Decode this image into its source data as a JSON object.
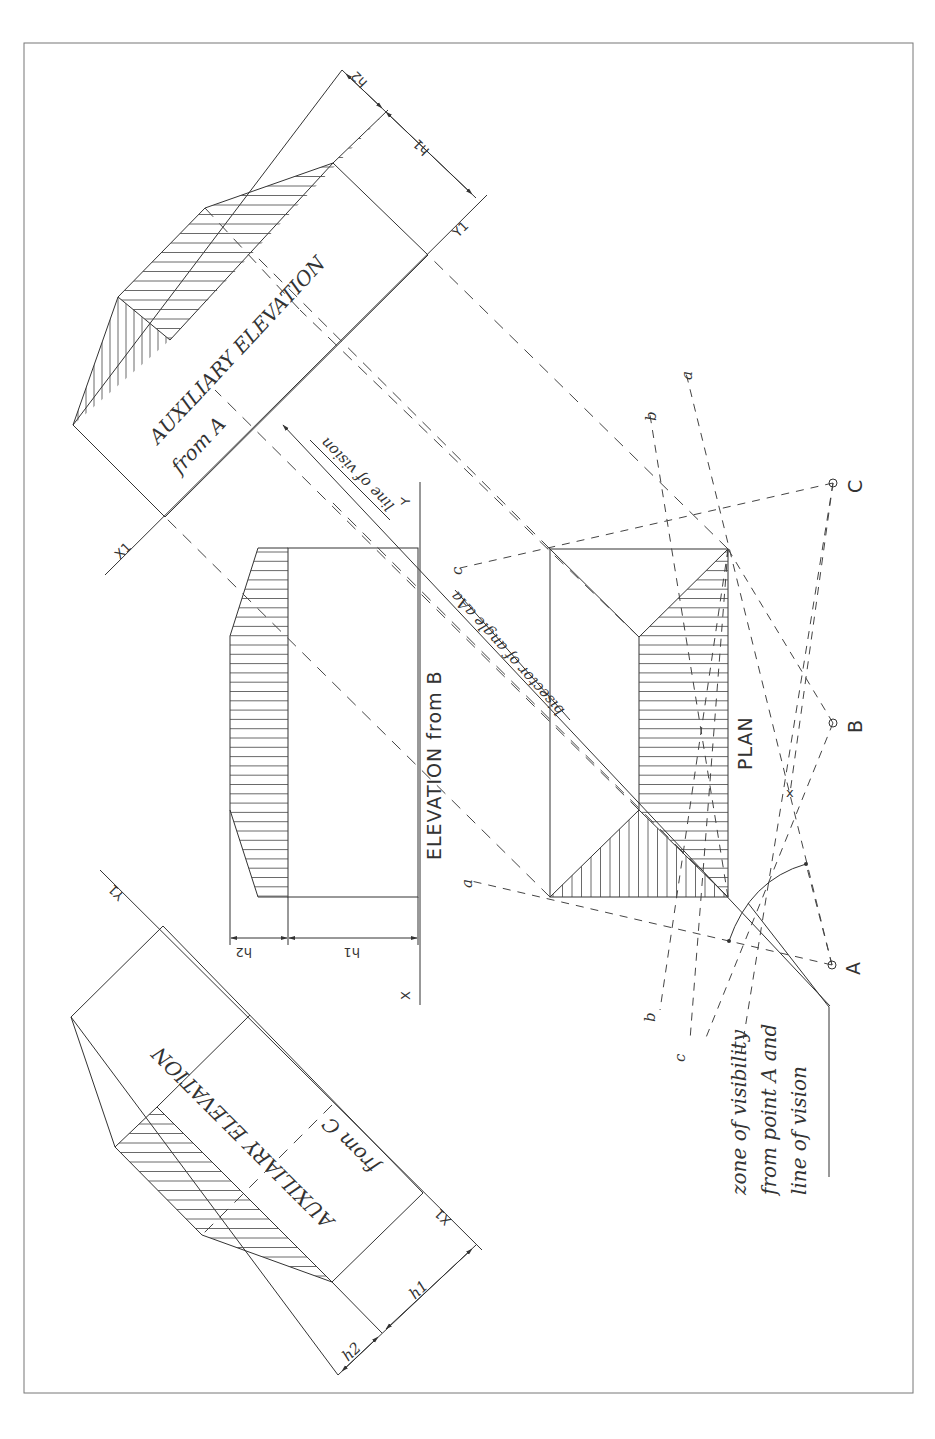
{
  "drawing": {
    "type": "orthographic projection - auxiliary elevations of a hipped roof",
    "views": {
      "plan": {
        "label": "PLAN"
      },
      "elevation_b": {
        "label": "ELEVATION from B",
        "x_label": "X",
        "y_label": "Y",
        "dim_h1": "h1",
        "dim_h2": "h2"
      },
      "aux_a": {
        "label_line1": "AUXILIARY ELEVATION",
        "label_line2": "from A",
        "x1_label": "X1",
        "y1_label": "Y1",
        "dim_h1": "h1",
        "dim_h2": "h2"
      },
      "aux_c": {
        "label_line1": "AUXILIARY ELEVATION",
        "label_line2": "from C",
        "x1_label": "X1",
        "y1_label": "Y1",
        "dim_h1": "h1",
        "dim_h2": "h2"
      }
    },
    "viewpoints": [
      {
        "name": "A",
        "label": "A"
      },
      {
        "name": "B",
        "label": "B"
      },
      {
        "name": "C",
        "label": "C"
      }
    ],
    "ray_labels": {
      "a_top": "a",
      "b_top": "b",
      "c_left": "c",
      "a_left": "a",
      "b_bottom": "b",
      "c_bottom": "c"
    },
    "annotations": {
      "line_of_vision": "line of vision",
      "bisector": "bisector of angle aAa",
      "zone_line1": "zone of visibility",
      "zone_line2": "from point A and",
      "zone_line3": "line of vision"
    }
  },
  "colors": {
    "ink": "#333333",
    "paper": "#ffffff",
    "frame": "#777777"
  }
}
